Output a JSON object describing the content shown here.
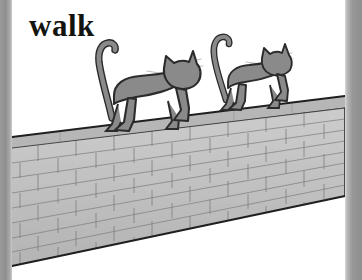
{
  "page": {
    "caption": "walk",
    "width": 362,
    "height": 280,
    "background": "#ffffff"
  },
  "palette": {
    "page_background": "#ffffff",
    "caption_text": "#14140f",
    "cat_fill": "#8a8a8a",
    "cat_outline": "#2b2b2b",
    "whisker": "#b9b9b9",
    "wall_face": "#c3c3c3",
    "wall_cap": "#b2b2b2",
    "wall_outline": "#1f1f1f",
    "mortar": "#7d7d7d",
    "edge_strip": "#9a9a9a"
  },
  "scene": {
    "name": "two-cats-walking-on-brick-wall",
    "description": "Illustration of two grey cats walking to the right along the top of a receding brick wall",
    "subjects": [
      {
        "name": "cat-front",
        "label": "cat",
        "order": 1,
        "facing": "right",
        "tail": "raised-curved",
        "position": {
          "x": 93,
          "y": 40,
          "width": 108,
          "height": 92
        }
      },
      {
        "name": "cat-back",
        "label": "cat",
        "order": 2,
        "facing": "right",
        "tail": "raised-curved",
        "position": {
          "x": 208,
          "y": 32,
          "width": 90,
          "height": 78
        }
      }
    ],
    "wall": {
      "name": "brick-wall",
      "label": "brick wall",
      "perspective": "descending-to-the-left",
      "top_edge": {
        "left_y": 136,
        "right_y": 96
      },
      "bottom_edge": {
        "left_y": 266,
        "right_y": 196
      },
      "brick_rows": 8,
      "cap_thickness": 11
    }
  },
  "edges": {
    "left_strip_label": "scan-edge-left",
    "right_strip_label": "scan-edge-right"
  }
}
